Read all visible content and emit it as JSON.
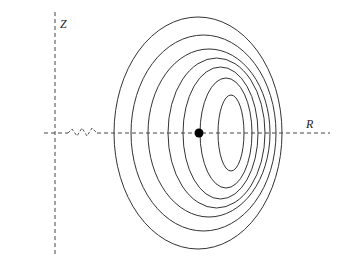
{
  "diagram": {
    "axis_labels": {
      "vertical": "Z",
      "horizontal": "R"
    },
    "colors": {
      "stroke": "#333333",
      "axis": "#444444",
      "dot": "#000000"
    },
    "axes": {
      "vertical": {
        "x": 55,
        "y1": 12,
        "y2": 255
      },
      "horizontal": {
        "y": 133,
        "x1": 44,
        "x2": 330
      }
    },
    "break_zigzag": [
      [
        68,
        133
      ],
      [
        72,
        129
      ],
      [
        77,
        136
      ],
      [
        82,
        128
      ],
      [
        87,
        136
      ],
      [
        92,
        128
      ],
      [
        97,
        133
      ]
    ],
    "center_dot": {
      "x": 199,
      "y": 133,
      "r": 4.5
    },
    "contours": [
      {
        "left": 114,
        "right": 282,
        "top": 17
      },
      {
        "left": 131,
        "right": 276,
        "top": 35
      },
      {
        "left": 148,
        "right": 270,
        "top": 49
      },
      {
        "left": 168,
        "right": 265,
        "top": 58
      },
      {
        "left": 183,
        "right": 258,
        "top": 67
      },
      {
        "left": 200,
        "right": 252,
        "top": 78
      },
      {
        "left": 218,
        "right": 244,
        "top": 95
      }
    ]
  }
}
